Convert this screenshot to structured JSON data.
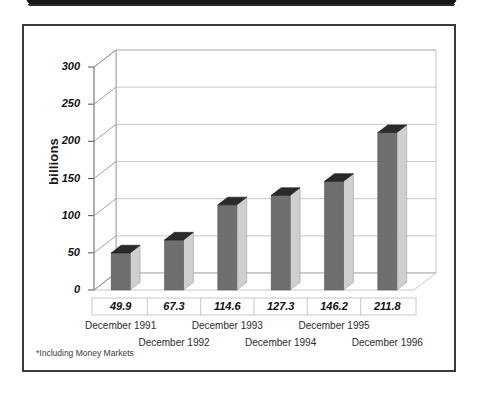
{
  "header": {
    "strip_label": "header-bar"
  },
  "figure": {
    "footnote": "*Including Money Markets"
  },
  "chart_data": {
    "type": "bar",
    "title": "",
    "subtitle": "",
    "xlabel": "",
    "ylabel": "billions",
    "categories": [
      "December 1991",
      "December 1992",
      "December 1993",
      "December 1994",
      "December 1995",
      "December 1996"
    ],
    "values": [
      49.9,
      67.3,
      114.6,
      127.3,
      146.2,
      211.8
    ],
    "value_labels": [
      "49.9",
      "67.3",
      "114.6",
      "127.3",
      "146.2",
      "211.8"
    ],
    "ylim": [
      0,
      300
    ],
    "yticks": [
      0,
      50,
      100,
      150,
      200,
      250,
      300
    ],
    "ytick_labels": [
      "0",
      "50",
      "100",
      "150",
      "200",
      "250",
      "300"
    ],
    "grid": true,
    "legend": "none",
    "style": "3d-column",
    "annotations": [
      "*Including Money Markets"
    ],
    "colors": {
      "bar_front": "#6f6f6f",
      "bar_side": "#cfcfcf",
      "bar_top": "#2a2a2a",
      "grid": "#b9b9b9",
      "axis": "#8c8c8c",
      "frame": "#3a3a3a",
      "text": "#111111",
      "header": "#171717"
    }
  }
}
